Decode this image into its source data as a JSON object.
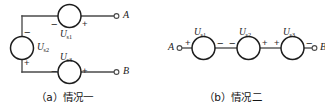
{
  "figure": {
    "kind": "circuit-diagram",
    "stroke_color": "#4a4a4a",
    "symbol_color": "#1d1d1d",
    "background": "#ffffff"
  },
  "panel_a": {
    "caption": "（a）情况一",
    "terminals": [
      {
        "name": "A",
        "label": "A"
      },
      {
        "name": "B",
        "label": "B"
      }
    ],
    "sources": [
      {
        "id": "us1",
        "label": "U",
        "subscript": "s1",
        "orientation": "horizontal",
        "branch": "top",
        "left_sign": "−",
        "right_sign": "+"
      },
      {
        "id": "us2",
        "label": "U",
        "subscript": "s2",
        "orientation": "vertical",
        "branch": "left",
        "top_sign": "−",
        "bottom_sign": "+"
      },
      {
        "id": "us3",
        "label": "U",
        "subscript": "s3",
        "orientation": "horizontal",
        "branch": "bottom",
        "left_sign": "−",
        "right_sign": "+"
      }
    ]
  },
  "panel_b": {
    "caption": "（b）情况二",
    "terminals": [
      {
        "name": "A",
        "label": "A"
      },
      {
        "name": "B",
        "label": "B"
      }
    ],
    "sources": [
      {
        "id": "us1",
        "label": "U",
        "subscript": "s1",
        "orientation": "horizontal",
        "left_sign": "+",
        "right_sign": "−"
      },
      {
        "id": "us2",
        "label": "U",
        "subscript": "s2",
        "orientation": "horizontal",
        "left_sign": "−",
        "right_sign": "+"
      },
      {
        "id": "us3",
        "label": "U",
        "subscript": "s3",
        "orientation": "horizontal",
        "left_sign": "+",
        "right_sign": "−"
      }
    ]
  }
}
